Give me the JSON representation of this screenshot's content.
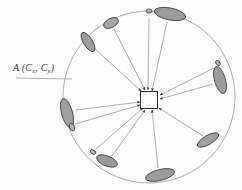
{
  "figure": {
    "type": "diagram",
    "width": 242,
    "height": 190,
    "background_color": "#fdfdfd",
    "title": ""
  },
  "colors": {
    "circle_stroke": "#9a9a9a",
    "line_stroke": "#8e8e8e",
    "arrow_fill": "#2a2a2a",
    "ellipse_fill": "#9b9b9b",
    "ellipse_fill_light": "#b5b5b5",
    "ellipse_stroke": "#3c3c3c",
    "center_box_fill": "#ffffff",
    "center_box_stroke": "#2e2e2e",
    "label_color": "#3a3a3a"
  },
  "center_marker": {
    "name": "center-square",
    "cx": 149,
    "cy": 100,
    "width": 17,
    "height": 17,
    "fill": "#ffffff",
    "stroke": "#2e2e2e"
  },
  "circle": {
    "name": "reference-circle",
    "cx": 149,
    "cy": 97,
    "r": 86,
    "stroke": "#9a9a9a",
    "stroke_width": 0.8,
    "fill": "none"
  },
  "annotation": {
    "label_prefix": "A",
    "label_full": "A (Cx, Cy)",
    "label_main": "A (C",
    "sub_x": "x",
    "label_mid": ", C",
    "sub_y": "y",
    "label_close": ")",
    "x": 13,
    "y": 62,
    "leader_line": {
      "x1": 16,
      "y1": 78,
      "x2": 72,
      "y2": 79
    }
  },
  "chart_data": {
    "type": "scatter",
    "title": "",
    "xlabel": "",
    "ylabel": "",
    "center": [
      149,
      97
    ],
    "radius": 86,
    "count": 12,
    "particles": [
      {
        "id": 1,
        "angle_deg": 284,
        "cx": 170,
        "cy": 14,
        "rx": 16,
        "ry": 6.0,
        "rot": 11,
        "shade": "#9b9b9b"
      },
      {
        "id": 2,
        "angle_deg": 253,
        "cx": 111,
        "cy": 23,
        "rx": 8,
        "ry": 4.5,
        "rot": -28,
        "shade": "#a5a5a5"
      },
      {
        "id": 3,
        "angle_deg": 228,
        "cx": 88,
        "cy": 42,
        "rx": 11,
        "ry": 4.5,
        "rot": 58,
        "shade": "#9b9b9b"
      },
      {
        "id": 4,
        "angle_deg": 185,
        "cx": 67,
        "cy": 113,
        "rx": 15,
        "ry": 5.5,
        "rot": 75,
        "shade": "#a0a0a0"
      },
      {
        "id": 5,
        "angle_deg": 145,
        "cx": 107,
        "cy": 161,
        "rx": 11,
        "ry": 5.0,
        "rot": 22,
        "shade": "#9b9b9b"
      },
      {
        "id": 6,
        "angle_deg": 118,
        "cx": 160,
        "cy": 175,
        "rx": 15,
        "ry": 5.5,
        "rot": -14,
        "shade": "#9b9b9b"
      },
      {
        "id": 7,
        "angle_deg": 62,
        "cx": 208,
        "cy": 140,
        "rx": 12,
        "ry": 4.5,
        "rot": -30,
        "shade": "#a0a0a0"
      },
      {
        "id": 8,
        "angle_deg": 18,
        "cx": 220,
        "cy": 80,
        "rx": 14,
        "ry": 5.5,
        "rot": 74,
        "shade": "#9b9b9b"
      },
      {
        "id": 9,
        "angle_deg": 270,
        "cx": 149,
        "cy": 11,
        "rx": 3,
        "ry": 2.0,
        "rot": 0,
        "shade": "#b5b5b5"
      },
      {
        "id": 10,
        "angle_deg": 200,
        "cx": 72,
        "cy": 127,
        "rx": 4,
        "ry": 2.5,
        "rot": 70,
        "shade": "#b0b0b0"
      },
      {
        "id": 11,
        "angle_deg": 160,
        "cx": 93,
        "cy": 152,
        "rx": 3,
        "ry": 2.0,
        "rot": 30,
        "shade": "#b5b5b5"
      },
      {
        "id": 12,
        "angle_deg": 40,
        "cx": 218,
        "cy": 63,
        "rx": 3,
        "ry": 2.0,
        "rot": 60,
        "shade": "#b5b5b5"
      }
    ],
    "connectors": [
      {
        "id": 1,
        "from": [
          167,
          22
        ],
        "to": [
          152,
          91
        ],
        "arrow": true
      },
      {
        "id": 2,
        "from": [
          114,
          29
        ],
        "to": [
          145,
          90
        ],
        "arrow": true
      },
      {
        "id": 3,
        "from": [
          93,
          47
        ],
        "to": [
          141,
          91
        ],
        "arrow": true
      },
      {
        "id": 4,
        "from": [
          76,
          110
        ],
        "to": [
          140,
          102
        ],
        "arrow": true
      },
      {
        "id": 5,
        "from": [
          112,
          156
        ],
        "to": [
          145,
          110
        ],
        "arrow": true
      },
      {
        "id": 6,
        "from": [
          158,
          168
        ],
        "to": [
          152,
          110
        ],
        "arrow": true
      },
      {
        "id": 7,
        "from": [
          203,
          136
        ],
        "to": [
          159,
          108
        ],
        "arrow": true
      },
      {
        "id": 8,
        "from": [
          213,
          84
        ],
        "to": [
          160,
          99
        ],
        "arrow": true
      },
      {
        "id": 9,
        "from": [
          149,
          18
        ],
        "to": [
          148,
          90
        ],
        "arrow": true
      },
      {
        "id": 10,
        "from": [
          75,
          124
        ],
        "to": [
          140,
          105
        ],
        "arrow": true
      },
      {
        "id": 11,
        "from": [
          96,
          149
        ],
        "to": [
          143,
          108
        ],
        "arrow": true
      },
      {
        "id": 12,
        "from": [
          214,
          68
        ],
        "to": [
          160,
          95
        ],
        "arrow": true
      }
    ]
  }
}
